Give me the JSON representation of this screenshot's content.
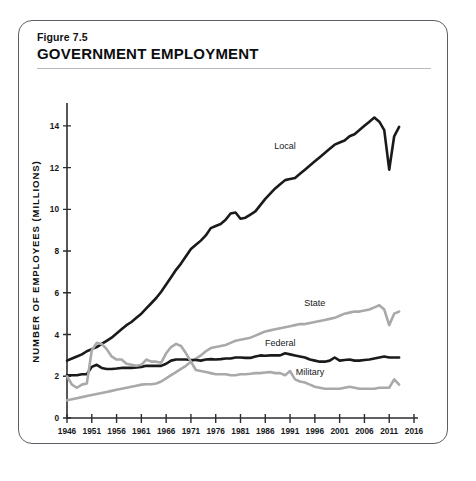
{
  "figure": {
    "number": "Figure 7.5",
    "title": "GOVERNMENT EMPLOYMENT"
  },
  "chart_data": {
    "type": "line",
    "title": "GOVERNMENT EMPLOYMENT",
    "xlabel": "YEAR",
    "ylabel": "NUMBER OF EMPLOYEES (MILLIONS)",
    "xlim": [
      1946,
      2016
    ],
    "ylim": [
      0,
      15
    ],
    "xticks": [
      1946,
      1951,
      1956,
      1961,
      1966,
      1971,
      1976,
      1981,
      1986,
      1991,
      1996,
      2001,
      2006,
      2011,
      2016
    ],
    "yticks": [
      0,
      2,
      4,
      6,
      8,
      10,
      12,
      14
    ],
    "grid": false,
    "legend": "inline-labels",
    "colors": {
      "local": "#1a1a1a",
      "federal": "#1a1a1a",
      "state": "#a9a9a9",
      "military": "#a9a9a9",
      "axis": "#2b2d31",
      "rule": "#b8bcc2",
      "border": "#5a5f66",
      "background": "#ffffff"
    },
    "series": [
      {
        "name": "Local",
        "color": "#1a1a1a",
        "stroke_width": 2.6,
        "label_x": 1990,
        "label_y": 12.9,
        "x": [
          1946,
          1947,
          1948,
          1949,
          1950,
          1951,
          1952,
          1953,
          1954,
          1955,
          1956,
          1957,
          1958,
          1959,
          1960,
          1961,
          1962,
          1963,
          1964,
          1965,
          1966,
          1967,
          1968,
          1969,
          1970,
          1971,
          1972,
          1973,
          1974,
          1975,
          1976,
          1977,
          1978,
          1979,
          1980,
          1981,
          1982,
          1983,
          1984,
          1985,
          1986,
          1987,
          1988,
          1989,
          1990,
          1991,
          1992,
          1993,
          1994,
          1995,
          1996,
          1997,
          1998,
          1999,
          2000,
          2001,
          2002,
          2003,
          2004,
          2005,
          2006,
          2007,
          2008,
          2009,
          2010,
          2011,
          2012,
          2013
        ],
        "values": [
          2.75,
          2.85,
          2.95,
          3.05,
          3.2,
          3.3,
          3.4,
          3.55,
          3.7,
          3.85,
          4.05,
          4.25,
          4.45,
          4.6,
          4.8,
          5.0,
          5.25,
          5.5,
          5.75,
          6.05,
          6.4,
          6.75,
          7.1,
          7.4,
          7.75,
          8.1,
          8.3,
          8.5,
          8.75,
          9.1,
          9.2,
          9.3,
          9.5,
          9.8,
          9.85,
          9.55,
          9.6,
          9.75,
          9.9,
          10.2,
          10.5,
          10.75,
          11.0,
          11.2,
          11.4,
          11.45,
          11.5,
          11.7,
          11.9,
          12.1,
          12.3,
          12.5,
          12.7,
          12.9,
          13.1,
          13.2,
          13.3,
          13.5,
          13.6,
          13.8,
          14.0,
          14.2,
          14.4,
          14.2,
          13.8,
          11.9,
          13.5,
          13.95
        ],
        "note": "State and local government education + other local employment; sharp V-shaped dip in 2011 artifact"
      },
      {
        "name": "State",
        "color": "#a9a9a9",
        "stroke_width": 2.6,
        "label_x": 1996,
        "label_y": 5.35,
        "x": [
          1946,
          1947,
          1948,
          1949,
          1950,
          1951,
          1952,
          1953,
          1954,
          1955,
          1956,
          1957,
          1958,
          1959,
          1960,
          1961,
          1962,
          1963,
          1964,
          1965,
          1966,
          1967,
          1968,
          1969,
          1970,
          1971,
          1972,
          1973,
          1974,
          1975,
          1976,
          1977,
          1978,
          1979,
          1980,
          1981,
          1982,
          1983,
          1984,
          1985,
          1986,
          1987,
          1988,
          1989,
          1990,
          1991,
          1992,
          1993,
          1994,
          1995,
          1996,
          1997,
          1998,
          1999,
          2000,
          2001,
          2002,
          2003,
          2004,
          2005,
          2006,
          2007,
          2008,
          2009,
          2010,
          2011,
          2012,
          2013
        ],
        "values": [
          0.85,
          0.9,
          0.95,
          1.0,
          1.05,
          1.1,
          1.15,
          1.2,
          1.25,
          1.3,
          1.35,
          1.4,
          1.45,
          1.5,
          1.55,
          1.6,
          1.62,
          1.62,
          1.65,
          1.75,
          1.9,
          2.05,
          2.2,
          2.35,
          2.5,
          2.7,
          2.85,
          3.0,
          3.2,
          3.35,
          3.4,
          3.45,
          3.5,
          3.6,
          3.7,
          3.75,
          3.8,
          3.85,
          3.95,
          4.05,
          4.15,
          4.2,
          4.25,
          4.3,
          4.35,
          4.4,
          4.45,
          4.5,
          4.5,
          4.55,
          4.6,
          4.65,
          4.7,
          4.75,
          4.8,
          4.9,
          5.0,
          5.05,
          5.1,
          5.1,
          5.15,
          5.2,
          5.3,
          5.4,
          5.2,
          4.45,
          5.0,
          5.1
        ]
      },
      {
        "name": "Federal",
        "color": "#1a1a1a",
        "stroke_width": 2.6,
        "label_x": 1989,
        "label_y": 3.45,
        "x": [
          1946,
          1947,
          1948,
          1949,
          1950,
          1951,
          1952,
          1953,
          1954,
          1955,
          1956,
          1957,
          1958,
          1959,
          1960,
          1961,
          1962,
          1963,
          1964,
          1965,
          1966,
          1967,
          1968,
          1969,
          1970,
          1971,
          1972,
          1973,
          1974,
          1975,
          1976,
          1977,
          1978,
          1979,
          1980,
          1981,
          1982,
          1983,
          1984,
          1985,
          1986,
          1987,
          1988,
          1989,
          1990,
          1991,
          1992,
          1993,
          1994,
          1995,
          1996,
          1997,
          1998,
          1999,
          2000,
          2001,
          2002,
          2003,
          2004,
          2005,
          2006,
          2007,
          2008,
          2009,
          2010,
          2011,
          2012,
          2013
        ],
        "values": [
          2.05,
          2.05,
          2.05,
          2.1,
          2.1,
          2.45,
          2.55,
          2.4,
          2.35,
          2.35,
          2.37,
          2.4,
          2.4,
          2.4,
          2.42,
          2.45,
          2.5,
          2.5,
          2.5,
          2.5,
          2.6,
          2.75,
          2.8,
          2.8,
          2.8,
          2.78,
          2.78,
          2.75,
          2.8,
          2.82,
          2.8,
          2.82,
          2.85,
          2.85,
          2.9,
          2.9,
          2.88,
          2.88,
          2.95,
          3.0,
          2.98,
          3.0,
          3.0,
          3.0,
          3.1,
          3.05,
          3.0,
          2.95,
          2.9,
          2.8,
          2.75,
          2.7,
          2.7,
          2.75,
          2.9,
          2.75,
          2.78,
          2.8,
          2.75,
          2.75,
          2.78,
          2.8,
          2.85,
          2.9,
          2.95,
          2.9,
          2.9,
          2.9
        ]
      },
      {
        "name": "Military",
        "color": "#a9a9a9",
        "stroke_width": 2.6,
        "label_x": 1995,
        "label_y": 2.05,
        "x": [
          1946,
          1947,
          1948,
          1949,
          1950,
          1951,
          1952,
          1953,
          1954,
          1955,
          1956,
          1957,
          1958,
          1959,
          1960,
          1961,
          1962,
          1963,
          1964,
          1965,
          1966,
          1967,
          1968,
          1969,
          1970,
          1971,
          1972,
          1973,
          1974,
          1975,
          1976,
          1977,
          1978,
          1979,
          1980,
          1981,
          1982,
          1983,
          1984,
          1985,
          1986,
          1987,
          1988,
          1989,
          1990,
          1991,
          1992,
          1993,
          1994,
          1995,
          1996,
          1997,
          1998,
          1999,
          2000,
          2001,
          2002,
          2003,
          2004,
          2005,
          2006,
          2007,
          2008,
          2009,
          2010,
          2011,
          2012,
          2013
        ],
        "values": [
          2.0,
          1.6,
          1.45,
          1.6,
          1.65,
          3.25,
          3.6,
          3.55,
          3.3,
          2.95,
          2.8,
          2.8,
          2.6,
          2.55,
          2.5,
          2.55,
          2.8,
          2.7,
          2.7,
          2.65,
          3.1,
          3.4,
          3.55,
          3.45,
          3.1,
          2.7,
          2.3,
          2.25,
          2.2,
          2.15,
          2.1,
          2.1,
          2.1,
          2.05,
          2.05,
          2.1,
          2.1,
          2.12,
          2.15,
          2.15,
          2.18,
          2.2,
          2.15,
          2.15,
          2.05,
          2.25,
          1.85,
          1.75,
          1.7,
          1.6,
          1.5,
          1.45,
          1.4,
          1.4,
          1.4,
          1.4,
          1.45,
          1.5,
          1.45,
          1.4,
          1.4,
          1.4,
          1.4,
          1.45,
          1.45,
          1.45,
          1.85,
          1.6
        ]
      }
    ]
  }
}
